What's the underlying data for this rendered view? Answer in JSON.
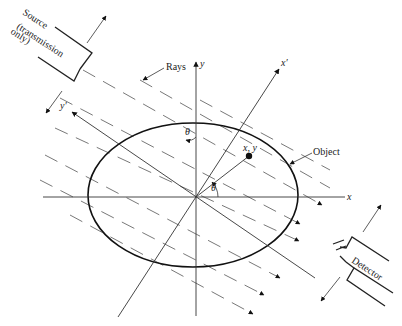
{
  "figure": {
    "type": "tomography-geometry",
    "colors": {
      "ink": "#222222",
      "background": "#ffffff",
      "ray": "#555555"
    },
    "labels": {
      "source_line1": "Source",
      "source_line2": "(transmission",
      "source_line3": "only)",
      "rays": "Rays",
      "object": "Object",
      "detector": "Detector",
      "axis_x": "x",
      "axis_y": "y",
      "axis_x_prime": "x′",
      "axis_y_prime": "y′",
      "point": "x, y",
      "theta_top": "θ",
      "theta_origin": "θ"
    }
  }
}
